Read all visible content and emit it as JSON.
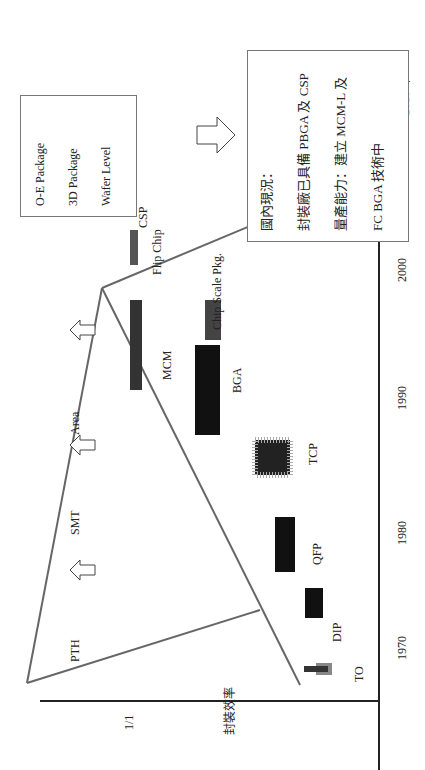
{
  "diagram": {
    "orientation": "rotated-90-ccw",
    "y_axis": {
      "label": "封裝效率",
      "tick": "1/1"
    },
    "x_axis": {
      "ticks": [
        "1970",
        "1980",
        "1990",
        "2000",
        "2010 年"
      ]
    },
    "eras": [
      "PTH",
      "SMT",
      "Area"
    ],
    "packages": [
      "TO",
      "DIP",
      "QFP",
      "TCP",
      "BGA",
      "MCM",
      "Chip Scale Pkg.",
      "Flip Chip",
      "CSP"
    ],
    "future_box": {
      "items": [
        "O-E Package",
        "3D Package",
        "Wafer Level"
      ]
    },
    "status_box": {
      "lines": [
        "國內現況：",
        "封裝廠已具備 PBGA 及 CSP",
        "量產能力：建立 MCM-L 及",
        "FC  BGA 技術中"
      ]
    }
  }
}
